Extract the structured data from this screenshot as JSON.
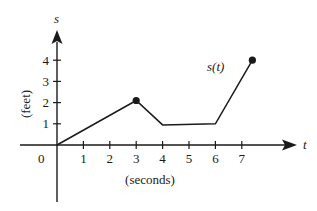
{
  "chart_data": {
    "type": "line",
    "title": "",
    "series_label": "s(t)",
    "xlabel": "(seconds)",
    "ylabel": "(feet)",
    "x_axis_name": "t",
    "y_axis_name": "s",
    "origin_label": "0",
    "x_ticks": [
      "1",
      "2",
      "3",
      "4",
      "5",
      "6",
      "7"
    ],
    "y_ticks": [
      "1",
      "2",
      "3",
      "4"
    ],
    "xlim": [
      -1.5,
      10.5
    ],
    "ylim": [
      -2.5,
      5
    ],
    "grid": false,
    "series": [
      {
        "name": "s(t)",
        "points": [
          {
            "t": 0,
            "s": 0
          },
          {
            "t": 3,
            "s": 2.1
          },
          {
            "t": 4,
            "s": 0.95
          },
          {
            "t": 6,
            "s": 1.0
          },
          {
            "t": 7.4,
            "s": 4
          }
        ],
        "marked_points": [
          {
            "t": 3,
            "s": 2.1
          },
          {
            "t": 7.4,
            "s": 4
          }
        ]
      }
    ]
  }
}
